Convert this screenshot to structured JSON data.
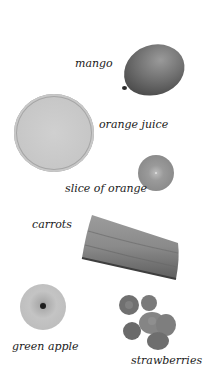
{
  "items": [
    {
      "id": "mango",
      "label": "mango"
    },
    {
      "id": "orange-juice",
      "label": "orange juice"
    },
    {
      "id": "slice-of-orange",
      "label": "slice of orange"
    },
    {
      "id": "carrots",
      "label": "carrots"
    },
    {
      "id": "green-apple",
      "label": "green apple"
    },
    {
      "id": "strawberries",
      "label": "strawberries"
    }
  ],
  "colors": {
    "background": "#ffffff",
    "text": "#1a1a1a"
  }
}
